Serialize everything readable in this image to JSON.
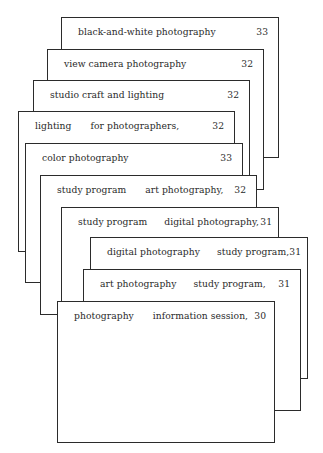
{
  "cards": [
    {
      "seg1": "black-and-white photography",
      "seg2": "",
      "number": "33"
    },
    {
      "seg1": "view camera photography",
      "seg2": "",
      "number": "32"
    },
    {
      "seg1": "studio craft and lighting",
      "seg2": "",
      "number": "32"
    },
    {
      "seg1": "lighting",
      "seg2": "for photographers,",
      "number": "32"
    },
    {
      "seg1": "color photography",
      "seg2": "",
      "number": "33"
    },
    {
      "seg1": "study program",
      "seg2": "art photography,",
      "number": "32"
    },
    {
      "seg1": "study program",
      "seg2": "digital photography,",
      "number": "31"
    },
    {
      "seg1": "digital photography",
      "seg2": "study program,",
      "number": "31"
    },
    {
      "seg1": "art photography",
      "seg2": "study program,",
      "number": "31"
    },
    {
      "seg1": "photography",
      "seg2": "information session,",
      "number": "30"
    }
  ],
  "colors": {
    "border": "#2b2b2b",
    "text": "#2a2a2a",
    "background": "#ffffff"
  }
}
